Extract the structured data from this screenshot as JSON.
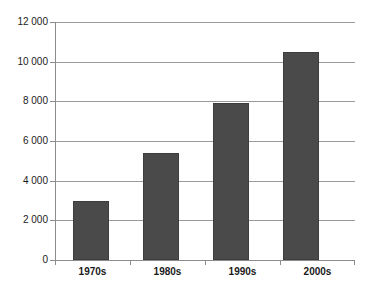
{
  "chart_data": {
    "type": "bar",
    "title": "",
    "subtitle": "",
    "xlabel": "",
    "ylabel": "",
    "categories": [
      "1970s",
      "1980s",
      "1990s",
      "2000s"
    ],
    "values": [
      3000,
      5400,
      7900,
      10500
    ],
    "ylim": [
      0,
      12000
    ],
    "ytick_values": [
      0,
      2000,
      4000,
      6000,
      8000,
      10000,
      12000
    ],
    "ytick_labels": [
      "0",
      "2 000",
      "4 000",
      "6 000",
      "8 000",
      "10 000",
      "12 000"
    ],
    "grid": true,
    "grid_axis": "y",
    "legend": false,
    "legend_position": "none",
    "series": [
      {
        "name": "",
        "values": [
          3000,
          5400,
          7900,
          10500
        ]
      }
    ],
    "colors": {
      "bar_fill": "#4a4a4a",
      "bar_border": "#3d3d3d",
      "gridline": "#9a9a9a",
      "axis": "#8c8c8c",
      "text": "#1a1a1a",
      "background": "#ffffff"
    }
  }
}
